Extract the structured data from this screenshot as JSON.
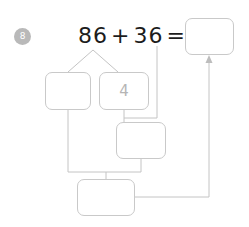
{
  "page": {
    "question_number": "8",
    "background_color": "#ffffff",
    "wire_color": "#c4c4c4",
    "box_border_color": "#c9c9c9",
    "badge_color": "#b9b9b9",
    "equation_text_color": "#1c1c1c",
    "handwriting_color": "#b5b5b5"
  },
  "equation": {
    "addend_one": "86",
    "plus_operator": "+",
    "addend_two": "36",
    "equals_operator": "="
  },
  "boxes": {
    "left": {
      "value": "",
      "label": "decomposition-left"
    },
    "right": {
      "value": "4",
      "label": "decomposition-right"
    },
    "middle": {
      "value": "",
      "label": "partial-sum"
    },
    "bottom": {
      "value": "",
      "label": "partial-sum-lower"
    },
    "answer": {
      "value": "",
      "label": "final-answer"
    }
  }
}
